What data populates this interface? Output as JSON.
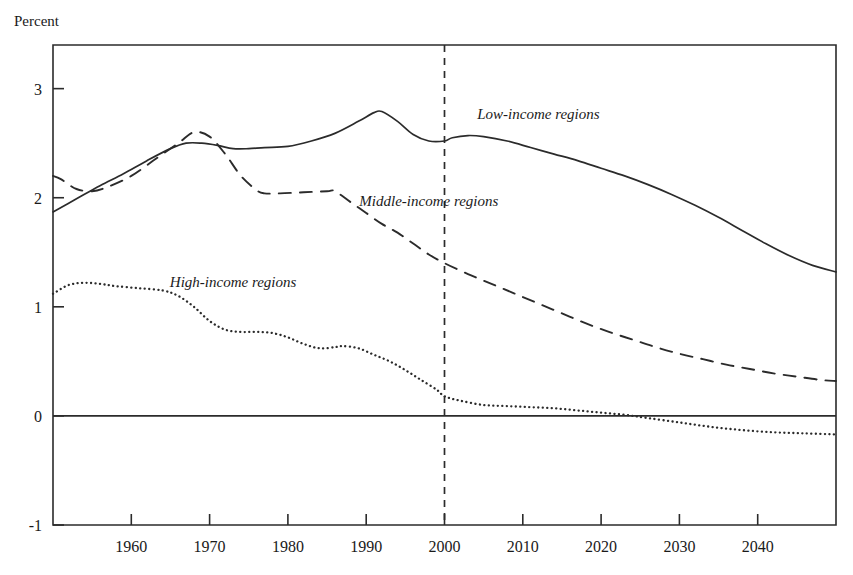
{
  "chart_data": {
    "type": "line",
    "title": "",
    "xlabel": "",
    "ylabel": "Percent",
    "xlim": [
      1950,
      2050
    ],
    "ylim": [
      -1,
      3.4
    ],
    "grid": false,
    "legend_position": "inline-annotations",
    "xticks": [
      1960,
      1970,
      1980,
      1990,
      2000,
      2010,
      2020,
      2030,
      2040
    ],
    "xtick_labels": [
      "1960",
      "1970",
      "1980",
      "1990",
      "2000",
      "2010",
      "2020",
      "2030",
      "2040"
    ],
    "yticks": [
      -1,
      0,
      1,
      2,
      3
    ],
    "ytick_labels": [
      "-1",
      "0",
      "1",
      "2",
      "3"
    ],
    "annotations": [
      {
        "text": "Low-income regions",
        "x": 2012,
        "y": 2.72,
        "style": "italic"
      },
      {
        "text": "Middle-income regions",
        "x": 1998,
        "y": 1.92,
        "style": "italic"
      },
      {
        "text": "High-income regions",
        "x": 1973,
        "y": 1.18,
        "style": "italic"
      }
    ],
    "reference_lines": [
      {
        "orientation": "vertical",
        "value": 2000,
        "style": "dashed",
        "label": "2000"
      },
      {
        "orientation": "horizontal",
        "value": 0,
        "style": "solid",
        "label": "0"
      }
    ],
    "series": [
      {
        "name": "Low-income regions",
        "style": "solid",
        "color": "#2b2b2b",
        "x": [
          1950,
          1953,
          1956,
          1959,
          1962,
          1965,
          1967,
          1969,
          1971,
          1973,
          1975,
          1977,
          1980,
          1983,
          1986,
          1989,
          1991,
          1992,
          1994,
          1996,
          1998,
          2000,
          2001,
          2003,
          2005,
          2008,
          2011,
          2014,
          2017,
          2020,
          2023,
          2026,
          2029,
          2032,
          2035,
          2038,
          2041,
          2044,
          2047,
          2050
        ],
        "y": [
          1.87,
          1.99,
          2.11,
          2.22,
          2.34,
          2.45,
          2.5,
          2.5,
          2.48,
          2.45,
          2.45,
          2.46,
          2.47,
          2.52,
          2.59,
          2.7,
          2.78,
          2.79,
          2.7,
          2.58,
          2.52,
          2.52,
          2.55,
          2.57,
          2.56,
          2.52,
          2.46,
          2.4,
          2.34,
          2.27,
          2.2,
          2.12,
          2.03,
          1.93,
          1.82,
          1.7,
          1.58,
          1.47,
          1.38,
          1.32
        ]
      },
      {
        "name": "Middle-income regions",
        "style": "dashed",
        "color": "#2b2b2b",
        "x": [
          1950,
          1951,
          1953,
          1955,
          1957,
          1960,
          1963,
          1966,
          1968,
          1970,
          1972,
          1974,
          1976,
          1977,
          1979,
          1982,
          1985,
          1986,
          1988,
          1990,
          1992,
          1994,
          1996,
          1998,
          2000,
          2003,
          2006,
          2009,
          2012,
          2015,
          2018,
          2021,
          2024,
          2027,
          2030,
          2033,
          2036,
          2039,
          2042,
          2045,
          2048,
          2050
        ],
        "y": [
          2.2,
          2.17,
          2.08,
          2.06,
          2.1,
          2.2,
          2.35,
          2.5,
          2.6,
          2.56,
          2.4,
          2.2,
          2.07,
          2.04,
          2.04,
          2.05,
          2.06,
          2.06,
          1.96,
          1.86,
          1.76,
          1.68,
          1.58,
          1.48,
          1.4,
          1.3,
          1.21,
          1.12,
          1.03,
          0.94,
          0.85,
          0.77,
          0.7,
          0.63,
          0.57,
          0.52,
          0.47,
          0.43,
          0.39,
          0.36,
          0.33,
          0.32
        ]
      },
      {
        "name": "High-income regions",
        "style": "dotted",
        "color": "#2b2b2b",
        "x": [
          1950,
          1952,
          1954,
          1956,
          1958,
          1961,
          1964,
          1966,
          1968,
          1970,
          1972,
          1974,
          1976,
          1978,
          1980,
          1982,
          1984,
          1986,
          1987,
          1989,
          1991,
          1993,
          1995,
          1997,
          1999,
          2000,
          2002,
          2005,
          2008,
          2011,
          2014,
          2017,
          2020,
          2023,
          2026,
          2030,
          2034,
          2038,
          2042,
          2046,
          2050
        ],
        "y": [
          1.12,
          1.2,
          1.22,
          1.21,
          1.19,
          1.17,
          1.15,
          1.1,
          1.0,
          0.87,
          0.79,
          0.77,
          0.77,
          0.76,
          0.72,
          0.66,
          0.62,
          0.63,
          0.64,
          0.62,
          0.56,
          0.5,
          0.42,
          0.33,
          0.24,
          0.18,
          0.14,
          0.1,
          0.09,
          0.08,
          0.07,
          0.05,
          0.03,
          0.01,
          -0.02,
          -0.06,
          -0.1,
          -0.13,
          -0.15,
          -0.16,
          -0.17
        ]
      }
    ]
  },
  "axes": {
    "y_axis_title": "Percent"
  }
}
